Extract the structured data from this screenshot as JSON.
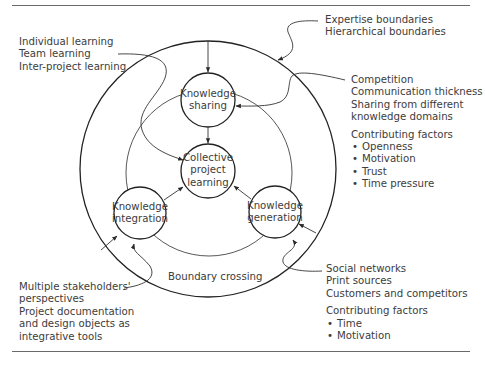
{
  "diagram": {
    "center_nodes": {
      "collective": {
        "lines": [
          "Collective",
          "project",
          "learning"
        ]
      },
      "sharing": {
        "lines": [
          "Knowledge",
          "sharing"
        ]
      },
      "integration": {
        "lines": [
          "Knowledge",
          "integration"
        ]
      },
      "generation": {
        "lines": [
          "Knowledge",
          "generation"
        ]
      }
    },
    "boundary_label": "Boundary crossing",
    "annotations": {
      "top_right": {
        "lines": [
          "Expertise boundaries",
          "Hierarchical boundaries"
        ]
      },
      "top_left": {
        "lines": [
          "Individual learning",
          "Team learning",
          "Inter-project learning"
        ]
      },
      "right_sharing": {
        "lines": [
          "Competition",
          "Communication thickness",
          "Sharing from different",
          "knowledge domains"
        ],
        "factors_title": "Contributing factors",
        "factors": [
          "Openness",
          "Motivation",
          "Trust",
          "Time pressure"
        ]
      },
      "bottom_left": {
        "lines": [
          "Multiple stakeholders'",
          "perspectives",
          "Project documentation",
          "and design objects as",
          "integrative tools"
        ]
      },
      "bottom_right": {
        "lines": [
          "Social networks",
          "Print sources",
          "Customers and competitors"
        ],
        "factors_title": "Contributing factors",
        "factors": [
          "Time",
          "Motivation"
        ]
      }
    },
    "colors": {
      "stroke": "#2a2a2a",
      "text": "#3c3c3c",
      "rule": "#6a6a6a"
    }
  }
}
